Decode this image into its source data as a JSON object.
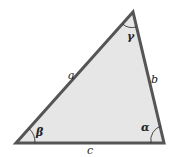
{
  "diagram": {
    "type": "triangle",
    "fill_color": "#e6e6e6",
    "stroke_color": "#555555",
    "vertices": {
      "top": [
        133,
        12
      ],
      "bottom_left": [
        16,
        143
      ],
      "bottom_right": [
        164,
        143
      ]
    },
    "sides": {
      "a": "a",
      "b": "b",
      "c": "c"
    },
    "angles": {
      "alpha": "α",
      "beta": "β",
      "gamma": "γ"
    }
  }
}
